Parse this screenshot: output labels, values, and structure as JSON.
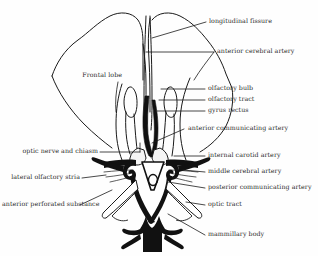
{
  "figure": {
    "background_color": "#fefefe",
    "ink_color": "#1a1a1a",
    "text_color": "#2b2b2b"
  },
  "labels": {
    "longitudinal_fissure": "longitudinal fissure",
    "anterior_cerebral_artery": "anterior cerebral artery",
    "frontal_lobe": "Frontal lobe",
    "olfactory_bulb": "olfactory bulb",
    "olfactory_tract": "olfactory tract",
    "gyrus_rectus": "gyrus rectus",
    "anterior_communicating_artery": "anterior communicating artery",
    "optic_nerve_and_chiasm": "optic nerve and chiasm",
    "internal_carotid_artery": "internal carotid artery",
    "lateral_olfactory_stria": "lateral olfactory stria",
    "middle_cerebral_artery": "middle cerebral artery",
    "posterior_communicating_artery": "posterior communicating artery",
    "anterior_perforated_substance": "anterior perforated substance",
    "optic_tract": "optic tract",
    "mammillary_body": "mammillary body"
  }
}
